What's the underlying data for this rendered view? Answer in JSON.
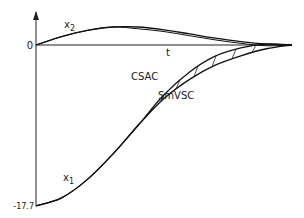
{
  "chart_data": {
    "type": "line",
    "title": "",
    "xlabel": "t",
    "ylabel": "",
    "y_tick_labels": [
      "0",
      "-17.7"
    ],
    "ylim": [
      -17.7,
      3.5
    ],
    "xlim": [
      0,
      1
    ],
    "grid": false,
    "legend": "none",
    "series": [
      {
        "name": "x2",
        "label": "x2",
        "x": [
          0,
          0.1,
          0.2,
          0.3,
          0.4,
          0.5,
          0.6,
          0.7,
          0.8,
          0.9,
          1.0
        ],
        "values": [
          0,
          1.2,
          2.1,
          2.6,
          2.6,
          2.2,
          1.6,
          1.0,
          0.5,
          0.15,
          0
        ]
      },
      {
        "name": "x1",
        "label": "x1",
        "x": [
          0,
          0.1,
          0.2,
          0.3,
          0.4,
          0.5,
          0.6,
          0.7,
          0.8,
          0.9,
          1.0
        ],
        "values": [
          -17.7,
          -16.8,
          -14.8,
          -12.0,
          -8.8,
          -5.8,
          -3.6,
          -2.0,
          -1.0,
          -0.3,
          0
        ]
      }
    ],
    "annotations": [
      {
        "text": "CSAC",
        "note": "upper branch of x1 in the hatched region"
      },
      {
        "text": "SmVSC",
        "note": "lower branch of x1 in the hatched region"
      }
    ],
    "subscript_labels": {
      "x2": "2",
      "x1": "1"
    }
  }
}
